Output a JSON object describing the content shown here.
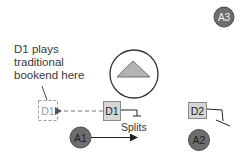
{
  "caption": {
    "lines": [
      "D1 plays",
      "traditional",
      "bookend here"
    ]
  },
  "nodes": {
    "d1_ghost": {
      "label": "D1",
      "style": "dashed"
    },
    "d1": {
      "label": "D1",
      "style": "solid"
    },
    "d2": {
      "label": "D2",
      "style": "solid"
    },
    "a1": {
      "label": "A1"
    },
    "a2": {
      "label": "A2"
    },
    "a3": {
      "label": "A3"
    }
  },
  "annotations": {
    "splits": "Splits"
  },
  "icons": {
    "center": "triangle-up-in-circle-icon"
  },
  "colors": {
    "box_fill": "#d6d6d6",
    "box_stroke": "#8a8a8a",
    "dashed_stroke": "#9a9a9a",
    "circle_fill": "#6e6e6e",
    "circle_stroke": "#4a4a4a",
    "triangle_fill": "#b4b4b4",
    "line": "#333333",
    "text": "#3a3a3a"
  }
}
